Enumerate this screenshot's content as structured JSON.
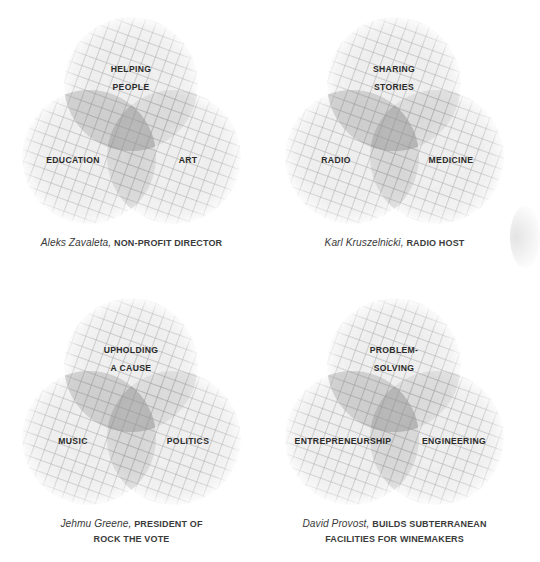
{
  "figure": {
    "type": "venn-diagram-grid",
    "columns": 2,
    "rows": 2,
    "background_color": "#ffffff",
    "circle_fill_color": "#d8d8d8",
    "circle_hatch_color": "#9a9a9a",
    "overlap_color": "#8d8d8d",
    "label_color": "#2b2b2b",
    "caption_color": "#3b3b3b"
  },
  "diagrams": [
    {
      "id": "aleks-zavaleta",
      "top_label_line1": "HELPING",
      "top_label_line2": "PEOPLE",
      "left_label": "EDUCATION",
      "right_label": "ART",
      "caption_name": "Aleks Zavaleta,",
      "caption_role": "NON-PROFIT DIRECTOR",
      "caption_role_line2": ""
    },
    {
      "id": "karl-kruszelnicki",
      "top_label_line1": "SHARING",
      "top_label_line2": "STORIES",
      "left_label": "RADIO",
      "right_label": "MEDICINE",
      "caption_name": "Karl Kruszelnicki,",
      "caption_role": "RADIO HOST",
      "caption_role_line2": ""
    },
    {
      "id": "jehmu-greene",
      "top_label_line1": "UPHOLDING",
      "top_label_line2": "A CAUSE",
      "left_label": "MUSIC",
      "right_label": "POLITICS",
      "caption_name": "Jehmu Greene,",
      "caption_role": "PRESIDENT OF",
      "caption_role_line2": "ROCK THE VOTE"
    },
    {
      "id": "david-provost",
      "top_label_line1": "PROBLEM-",
      "top_label_line2": "SOLVING",
      "left_label": "ENTREPRENEURSHIP",
      "right_label": "ENGINEERING",
      "caption_name": "David Provost,",
      "caption_role": "BUILDS SUBTERRANEAN",
      "caption_role_line2": "FACILITIES FOR WINEMAKERS"
    }
  ]
}
